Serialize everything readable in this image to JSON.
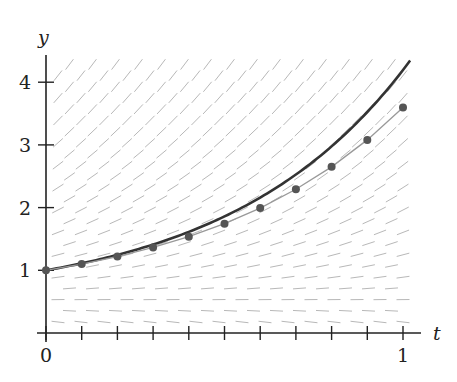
{
  "chart_data": {
    "type": "line",
    "title": "",
    "xlabel": "t",
    "ylabel": "y",
    "xlim": [
      0,
      1
    ],
    "ylim": [
      0,
      4.4
    ],
    "x_tick_labels": [
      "0",
      "1"
    ],
    "x_minor_ticks": [
      0.1,
      0.2,
      0.3,
      0.4,
      0.5,
      0.6,
      0.7,
      0.8,
      0.9
    ],
    "y_tick_labels": [
      "1",
      "2",
      "3",
      "4"
    ],
    "y_ticks": [
      1,
      2,
      3,
      4
    ],
    "grid": false,
    "legend": null,
    "slope_field": {
      "description": "direction field of y' = 2y - 1",
      "color": "#b8b8b8"
    },
    "series": [
      {
        "name": "exact solution",
        "style": "thick dark curve",
        "color": "#333333",
        "x": [
          0,
          0.1,
          0.2,
          0.3,
          0.4,
          0.5,
          0.6,
          0.7,
          0.8,
          0.9,
          1.0,
          1.02
        ],
        "values": [
          1.0,
          1.111,
          1.246,
          1.411,
          1.613,
          1.859,
          2.16,
          2.528,
          2.977,
          3.525,
          4.195,
          4.347
        ]
      },
      {
        "name": "Euler approximation (h = 0.1)",
        "style": "thin gray line with dots",
        "color": "#999999",
        "marker_color": "#555555",
        "x": [
          0,
          0.1,
          0.2,
          0.3,
          0.4,
          0.5,
          0.6,
          0.7,
          0.8,
          0.9,
          1.0
        ],
        "values": [
          1.0,
          1.1,
          1.22,
          1.364,
          1.537,
          1.744,
          1.993,
          2.292,
          2.65,
          3.08,
          3.596
        ]
      }
    ]
  }
}
